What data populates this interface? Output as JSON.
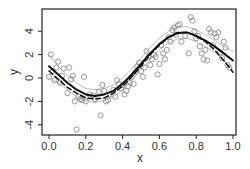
{
  "chart_data": {
    "type": "scatter",
    "title": "",
    "xlabel": "x",
    "ylabel": "y",
    "xlim": [
      -0.04,
      1.02
    ],
    "ylim": [
      -5.0,
      6.0
    ],
    "grid": false,
    "legend": null,
    "xticks": [
      0.0,
      0.2,
      0.4,
      0.6,
      0.8,
      1.0
    ],
    "xtick_labels": [
      "0.0",
      "0.2",
      "0.4",
      "0.6",
      "0.8",
      "1.0"
    ],
    "yticks": [
      -4,
      -2,
      0,
      2,
      4
    ],
    "ytick_labels": [
      "-4",
      "-2",
      "0",
      "2",
      "4"
    ],
    "series": [
      {
        "name": "observations",
        "kind": "points",
        "marker": "open-circle",
        "color": "#8c8c8c",
        "x": [
          0.0,
          0.01,
          0.02,
          0.03,
          0.04,
          0.05,
          0.06,
          0.07,
          0.08,
          0.1,
          0.11,
          0.12,
          0.13,
          0.14,
          0.15,
          0.16,
          0.17,
          0.18,
          0.19,
          0.2,
          0.22,
          0.24,
          0.25,
          0.27,
          0.28,
          0.29,
          0.3,
          0.31,
          0.32,
          0.33,
          0.35,
          0.36,
          0.37,
          0.38,
          0.39,
          0.4,
          0.41,
          0.42,
          0.43,
          0.44,
          0.45,
          0.46,
          0.47,
          0.48,
          0.49,
          0.5,
          0.51,
          0.52,
          0.53,
          0.54,
          0.55,
          0.56,
          0.57,
          0.58,
          0.59,
          0.6,
          0.61,
          0.62,
          0.63,
          0.64,
          0.65,
          0.66,
          0.67,
          0.68,
          0.69,
          0.7,
          0.71,
          0.72,
          0.74,
          0.76,
          0.77,
          0.78,
          0.79,
          0.8,
          0.81,
          0.82,
          0.83,
          0.84,
          0.85,
          0.86,
          0.87,
          0.88,
          0.89,
          0.9,
          0.91,
          0.92,
          0.93,
          0.94,
          0.95,
          0.96,
          0.97,
          0.98
        ],
        "y": [
          0.1,
          2.0,
          0.6,
          -0.2,
          0.9,
          1.4,
          -0.4,
          0.2,
          0.8,
          -1.3,
          0.9,
          -0.1,
          0.2,
          -2.0,
          -4.4,
          -1.6,
          -1.8,
          -1.9,
          0.1,
          -2.0,
          -1.4,
          -1.5,
          -1.8,
          -1.2,
          -3.2,
          -0.6,
          -1.1,
          -2.0,
          -1.9,
          -1.4,
          -1.0,
          -1.6,
          -0.2,
          -0.5,
          -0.9,
          -0.6,
          -1.4,
          -1.1,
          -0.7,
          -0.4,
          0.1,
          -0.5,
          0.5,
          1.0,
          1.3,
          0.6,
          0.1,
          0.9,
          2.3,
          1.8,
          1.1,
          1.6,
          2.0,
          1.8,
          0.3,
          1.2,
          2.8,
          2.1,
          1.6,
          2.4,
          3.5,
          3.1,
          4.1,
          4.3,
          3.7,
          4.5,
          4.6,
          3.1,
          3.6,
          2.1,
          5.2,
          4.9,
          4.0,
          3.4,
          3.6,
          2.7,
          2.1,
          1.6,
          2.4,
          1.5,
          4.2,
          3.9,
          2.8,
          3.8,
          3.5,
          3.9,
          2.2,
          1.7,
          3.1,
          2.6,
          1.1,
          0.9
        ],
        "comment": "approximate positions estimated from pixels"
      },
      {
        "name": "fitted curve",
        "kind": "line",
        "style": "solid",
        "color": "#111111",
        "width": 2,
        "x": [
          0.0,
          0.05,
          0.1,
          0.15,
          0.2,
          0.25,
          0.3,
          0.35,
          0.4,
          0.45,
          0.5,
          0.55,
          0.6,
          0.65,
          0.7,
          0.75,
          0.8,
          0.85,
          0.9,
          0.95,
          1.0
        ],
        "y": [
          1.0,
          0.3,
          -0.4,
          -1.0,
          -1.4,
          -1.55,
          -1.4,
          -1.1,
          -0.5,
          0.3,
          1.2,
          2.1,
          2.9,
          3.5,
          3.85,
          3.9,
          3.6,
          3.2,
          2.7,
          2.1,
          1.5
        ]
      },
      {
        "name": "true function",
        "kind": "line",
        "style": "dashed",
        "color": "#111111",
        "width": 1.5,
        "x": [
          0.0,
          0.05,
          0.1,
          0.15,
          0.2,
          0.25,
          0.3,
          0.35,
          0.4,
          0.45,
          0.5,
          0.55,
          0.6,
          0.65,
          0.7,
          0.75,
          0.8,
          0.85,
          0.9,
          0.95,
          1.0
        ],
        "y": [
          0.6,
          -0.1,
          -0.8,
          -1.3,
          -1.7,
          -1.8,
          -1.7,
          -1.3,
          -0.7,
          0.1,
          1.0,
          2.0,
          2.8,
          3.5,
          3.9,
          3.9,
          3.6,
          3.1,
          2.4,
          1.5,
          0.5
        ]
      },
      {
        "name": "upper band",
        "kind": "line",
        "style": "solid",
        "color": "#bdbdbd",
        "width": 1,
        "x": [
          0.0,
          0.05,
          0.1,
          0.15,
          0.2,
          0.25,
          0.3,
          0.35,
          0.4,
          0.45,
          0.5,
          0.55,
          0.6,
          0.65,
          0.7,
          0.75,
          0.8,
          0.85,
          0.9,
          0.95,
          1.0
        ],
        "y": [
          2.0,
          1.0,
          0.2,
          -0.4,
          -0.9,
          -1.0,
          -0.9,
          -0.6,
          0.0,
          0.8,
          1.7,
          2.6,
          3.4,
          4.0,
          4.35,
          4.4,
          4.1,
          3.7,
          3.2,
          2.7,
          2.3
        ]
      },
      {
        "name": "lower band",
        "kind": "line",
        "style": "solid",
        "color": "#bdbdbd",
        "width": 1,
        "x": [
          0.0,
          0.05,
          0.1,
          0.15,
          0.2,
          0.25,
          0.3,
          0.35,
          0.4,
          0.45,
          0.5,
          0.55,
          0.6,
          0.65,
          0.7,
          0.75,
          0.8,
          0.85,
          0.9,
          0.95,
          1.0
        ],
        "y": [
          0.0,
          -0.4,
          -1.0,
          -1.6,
          -1.9,
          -2.1,
          -1.9,
          -1.6,
          -1.0,
          -0.2,
          0.7,
          1.6,
          2.4,
          3.0,
          3.35,
          3.4,
          3.1,
          2.7,
          2.2,
          1.5,
          0.7
        ]
      }
    ]
  }
}
